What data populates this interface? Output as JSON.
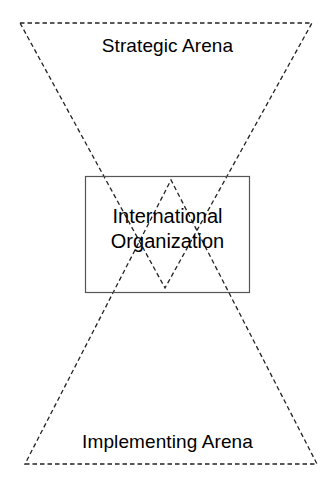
{
  "diagram": {
    "background_color": "#ffffff",
    "stroke_color": "#222222",
    "text_color": "#000000",
    "box_border_color": "#555555",
    "canvas": {
      "width": 335,
      "height": 488
    },
    "labels": {
      "strategic_arena": "Strategic Arena",
      "implementing_arena": "Implementing Arena",
      "international_organization": "International\nOrganization"
    },
    "shapes": {
      "upper_triangle": {
        "name": "strategic-arena-triangle",
        "style": "dashed",
        "points": "20,23 312,23 165,288"
      },
      "lower_triangle": {
        "name": "implementing-arena-triangle",
        "style": "dashed",
        "points": "25,464 317,464 171,180"
      },
      "center_rectangle": {
        "name": "international-organization-box",
        "style": "solid",
        "x": 85,
        "y": 176,
        "width": 165,
        "height": 117
      }
    }
  }
}
